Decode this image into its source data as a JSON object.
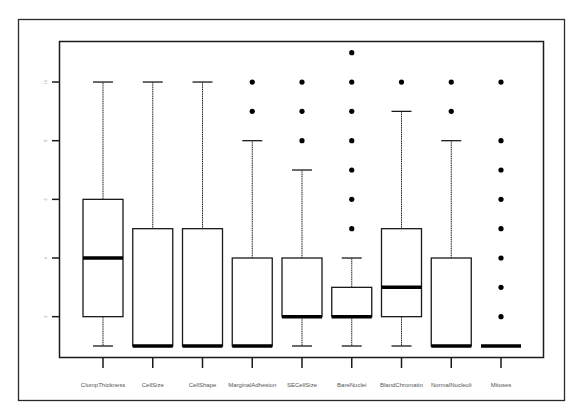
{
  "chart_data": {
    "type": "boxplot",
    "title": "",
    "xlabel": "",
    "ylabel": "",
    "ylim": [
      1,
      11
    ],
    "yticks": [
      2,
      4,
      6,
      8,
      10
    ],
    "ytick_labels": [
      "2",
      "4",
      "6",
      "8",
      "10"
    ],
    "grid": false,
    "legend": null,
    "categories": [
      "ClumpThickness",
      "CellSize",
      "CellShape",
      "MarginalAdhesion",
      "SECellSize",
      "BareNuclei",
      "BlandChromatin",
      "NormalNucleoli",
      "Mitoses"
    ],
    "series": [
      {
        "name": "ClumpThickness",
        "whisker_low": 1,
        "q1": 2,
        "median": 4,
        "q3": 6,
        "whisker_high": 10,
        "outliers": []
      },
      {
        "name": "CellSize",
        "whisker_low": 1,
        "q1": 1,
        "median": 1,
        "q3": 5,
        "whisker_high": 10,
        "outliers": []
      },
      {
        "name": "CellShape",
        "whisker_low": 1,
        "q1": 1,
        "median": 1,
        "q3": 5,
        "whisker_high": 10,
        "outliers": []
      },
      {
        "name": "MarginalAdhesion",
        "whisker_low": 1,
        "q1": 1,
        "median": 1,
        "q3": 4,
        "whisker_high": 8,
        "outliers": [
          9,
          10
        ]
      },
      {
        "name": "SECellSize",
        "whisker_low": 1,
        "q1": 2,
        "median": 2,
        "q3": 4,
        "whisker_high": 7,
        "outliers": [
          8,
          9,
          10
        ]
      },
      {
        "name": "BareNuclei",
        "whisker_low": 1,
        "q1": 2,
        "median": 2,
        "q3": 3,
        "whisker_high": 4,
        "outliers": [
          5,
          6,
          7,
          8,
          9,
          10,
          11
        ]
      },
      {
        "name": "BlandChromatin",
        "whisker_low": 1,
        "q1": 2,
        "median": 3,
        "q3": 5,
        "whisker_high": 9,
        "outliers": [
          10
        ]
      },
      {
        "name": "NormalNucleoli",
        "whisker_low": 1,
        "q1": 1,
        "median": 1,
        "q3": 4,
        "whisker_high": 8,
        "outliers": [
          9,
          10
        ]
      },
      {
        "name": "Mitoses",
        "whisker_low": 1,
        "q1": 1,
        "median": 1,
        "q3": 1,
        "whisker_high": 1,
        "outliers": [
          2,
          3,
          4,
          5,
          6,
          7,
          8,
          10
        ]
      }
    ]
  }
}
